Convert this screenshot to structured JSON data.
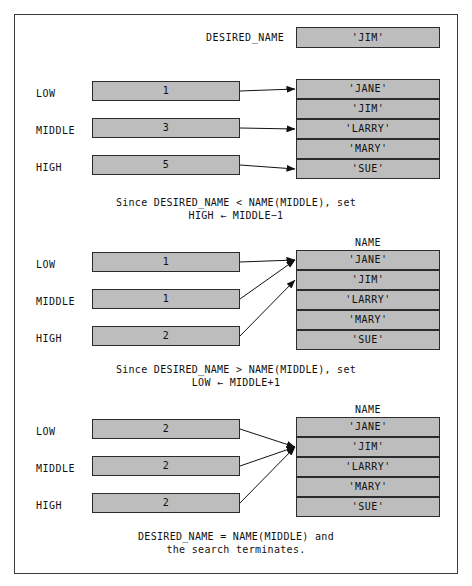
{
  "figure": {
    "title_box": {
      "label": "DESIRED_NAME",
      "value": "'JIM'"
    },
    "name_table_header": "NAME",
    "names": [
      "'JANE'",
      "'JIM'",
      "'LARRY'",
      "'MARY'",
      "'SUE'"
    ],
    "colors": {
      "box_fill": "#bdbdbd",
      "box_border": "#2b2b2b",
      "frame_border": "#3a3a3a",
      "background": "#ffffff",
      "arrow": "#111111"
    },
    "panels": [
      {
        "id": "panel-1",
        "show_name_header": false,
        "vars": [
          {
            "name": "LOW",
            "value": "1",
            "points_to_row": 1
          },
          {
            "name": "MIDDLE",
            "value": "3",
            "points_to_row": 3
          },
          {
            "name": "HIGH",
            "value": "5",
            "points_to_row": 5
          }
        ],
        "caption_line1": "Since DESIRED_NAME < NAME(MIDDLE), set",
        "caption_line2": "HIGH ← MIDDLE−1"
      },
      {
        "id": "panel-2",
        "show_name_header": true,
        "vars": [
          {
            "name": "LOW",
            "value": "1",
            "points_to_row": 1
          },
          {
            "name": "MIDDLE",
            "value": "1",
            "points_to_row": 1
          },
          {
            "name": "HIGH",
            "value": "2",
            "points_to_row": 2
          }
        ],
        "caption_line1": "Since DESIRED_NAME > NAME(MIDDLE), set",
        "caption_line2": "LOW ← MIDDLE+1"
      },
      {
        "id": "panel-3",
        "show_name_header": true,
        "vars": [
          {
            "name": "LOW",
            "value": "2",
            "points_to_row": 2
          },
          {
            "name": "MIDDLE",
            "value": "2",
            "points_to_row": 2
          },
          {
            "name": "HIGH",
            "value": "2",
            "points_to_row": 2
          }
        ],
        "caption_line1": "DESIRED_NAME = NAME(MIDDLE) and",
        "caption_line2": "the search terminates."
      }
    ]
  }
}
